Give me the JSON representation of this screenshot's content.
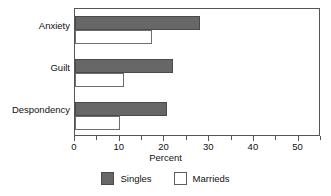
{
  "chart_data": {
    "type": "bar",
    "orientation": "horizontal",
    "title": "",
    "xlabel": "Percent",
    "ylabel": "",
    "categories": [
      "Anxiety",
      "Guilt",
      "Despondency"
    ],
    "series": [
      {
        "name": "Singles",
        "color": "#676767",
        "values": [
          28.0,
          22.0,
          20.5
        ]
      },
      {
        "name": "Marrieds",
        "color": "#ffffff",
        "values": [
          17.3,
          11.0,
          10.0
        ]
      }
    ],
    "xlim": [
      0,
      55
    ],
    "xticks": [
      0,
      10,
      20,
      30,
      40,
      50
    ],
    "xtick_labels": [
      "0",
      "10",
      "20",
      "30",
      "40",
      "50"
    ],
    "xminor_ticks": [
      5,
      15,
      25,
      35,
      45,
      55
    ],
    "grid": false,
    "legend_position": "bottom-center",
    "legend": [
      {
        "label": "Singles",
        "swatch": "#676767"
      },
      {
        "label": "Marrieds",
        "swatch": "#ffffff"
      }
    ]
  }
}
